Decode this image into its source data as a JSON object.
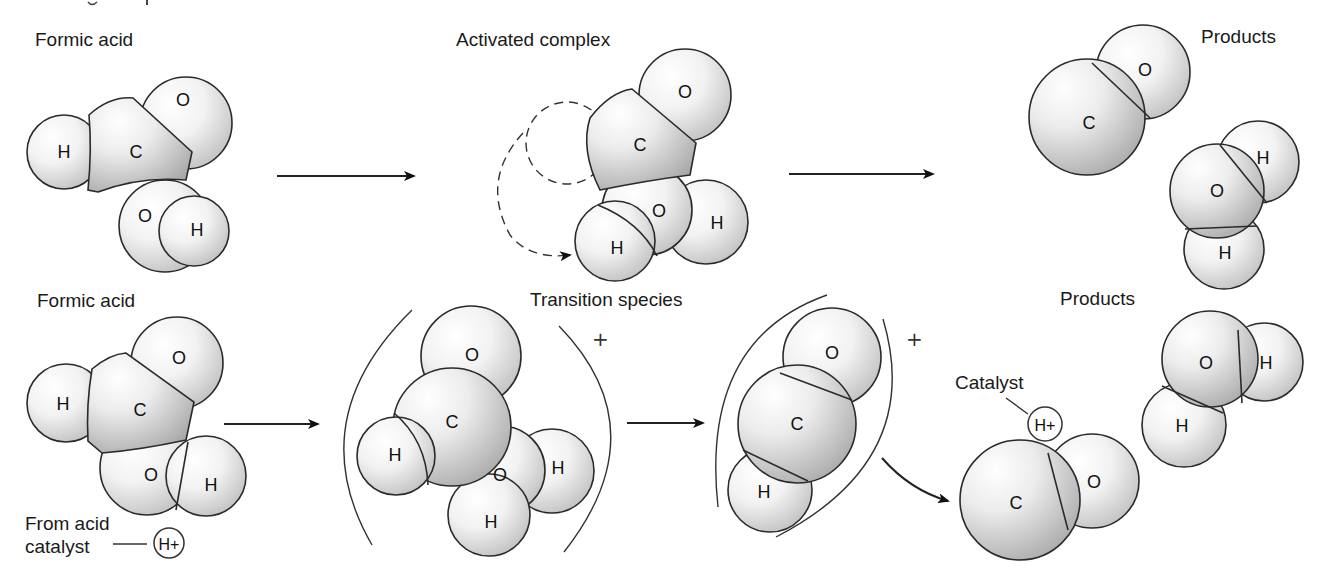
{
  "diagram": {
    "colors": {
      "atom_light": "#ffffff",
      "atom_shade": "#c4c4c4",
      "outline": "#2a2a2a",
      "text": "#111111",
      "background": "#ffffff"
    },
    "top_row": {
      "reactant": {
        "label": "Formic acid",
        "atoms": [
          "H",
          "C",
          "O",
          "O",
          "H"
        ]
      },
      "intermediate": {
        "label": "Activated complex",
        "atoms": [
          "C",
          "O",
          "O",
          "H",
          "H"
        ]
      },
      "products": {
        "label": "Products",
        "molecules": [
          {
            "name": "carbon-monoxide",
            "atoms": [
              "C",
              "O"
            ]
          },
          {
            "name": "water",
            "atoms": [
              "O",
              "H",
              "H"
            ]
          }
        ]
      }
    },
    "bottom_row": {
      "reactant": {
        "label": "Formic acid",
        "atoms": [
          "H",
          "C",
          "O",
          "O",
          "H"
        ],
        "catalyst_label_line1": "From acid",
        "catalyst_label_line2": "catalyst",
        "catalyst_ion": "H+"
      },
      "intermediate": {
        "label": "Transition species",
        "charge_1": "+",
        "charge_2": "+",
        "species_1_atoms": [
          "H",
          "C",
          "O",
          "O",
          "H",
          "H"
        ],
        "species_2_atoms": [
          "H",
          "C",
          "O"
        ]
      },
      "products": {
        "label": "Products",
        "catalyst_label": "Catalyst",
        "catalyst_ion": "H+",
        "molecules": [
          {
            "name": "water",
            "atoms": [
              "O",
              "H",
              "H"
            ]
          },
          {
            "name": "carbon-monoxide",
            "atoms": [
              "C",
              "O"
            ]
          }
        ]
      }
    },
    "symbols": {
      "H": "H",
      "C": "C",
      "O": "O"
    }
  }
}
